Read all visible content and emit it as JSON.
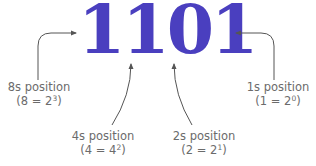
{
  "diagram": {
    "number": "1101",
    "number_color": "#4a3fbf",
    "line_color": "#555555",
    "label_color": "#6b6b6b",
    "labels": [
      {
        "id": "8s",
        "title": "8s position",
        "expr_base": "(8 = 2",
        "expr_exp": "3",
        "expr_close": ")"
      },
      {
        "id": "4s",
        "title": "4s position",
        "expr_base": "(4 = 4",
        "expr_exp": "2",
        "expr_close": ")"
      },
      {
        "id": "2s",
        "title": "2s position",
        "expr_base": "(2 = 2",
        "expr_exp": "1",
        "expr_close": ")"
      },
      {
        "id": "1s",
        "title": "1s position",
        "expr_base": "(1 = 2",
        "expr_exp": "0",
        "expr_close": ")"
      }
    ]
  }
}
